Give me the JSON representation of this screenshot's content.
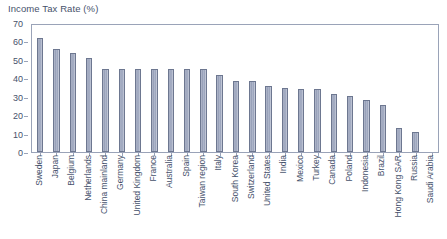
{
  "chart_data": {
    "type": "bar",
    "title": "Income Tax Rate (%)",
    "xlabel": "",
    "ylabel": "",
    "ylim": [
      0,
      70
    ],
    "ytick_step": 10,
    "yticks": [
      0,
      10,
      20,
      30,
      40,
      50,
      60,
      70
    ],
    "grid": false,
    "legend": "none",
    "bar_color": "#9aa3bb",
    "bar_edge_color": "#6d7790",
    "axis_color": "#9aa3b8",
    "text_color": "#46516b",
    "categories": [
      "Sweden",
      "Japan",
      "Belgium",
      "Netherlands",
      "China mainland",
      "Germany",
      "United Kingdom",
      "France",
      "Australia",
      "Spain",
      "Taiwan region",
      "Italy",
      "South Korea",
      "Switzerland",
      "United States",
      "India",
      "Mexico",
      "Turkey",
      "Canada",
      "Poland",
      "Indonesia",
      "Brazil",
      "Hong Kong SAR",
      "Russia",
      "Saudi Arabia"
    ],
    "values": [
      61.9,
      55.9,
      53.5,
      51.0,
      45.0,
      45.0,
      45.0,
      45.0,
      45.0,
      45.0,
      45.0,
      42.0,
      38.5,
      38.5,
      36.0,
      35.0,
      34.0,
      34.0,
      31.5,
      30.5,
      28.0,
      25.5,
      13.0,
      11.0,
      0.0
    ]
  }
}
